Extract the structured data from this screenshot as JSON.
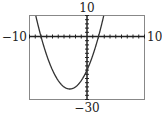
{
  "chart_data": {
    "type": "line",
    "title": "",
    "function": "x^2 + 6x - 16",
    "coefficients": {
      "a": 1,
      "b": 6,
      "c": -16
    },
    "x_intercepts": [
      -8,
      2
    ],
    "y_intercept": -16,
    "vertex": [
      -3,
      -25
    ],
    "xlim": [
      -10,
      10
    ],
    "ylim": [
      -30,
      10
    ],
    "xscale": 1,
    "yscale": 2,
    "grid": false,
    "labels": {
      "ymax": "10",
      "ymin": "−30",
      "xmin": "−10",
      "xmax": "10"
    },
    "colors": {
      "curve": "#333333",
      "axes": "#222222",
      "frame": "#888888"
    }
  }
}
